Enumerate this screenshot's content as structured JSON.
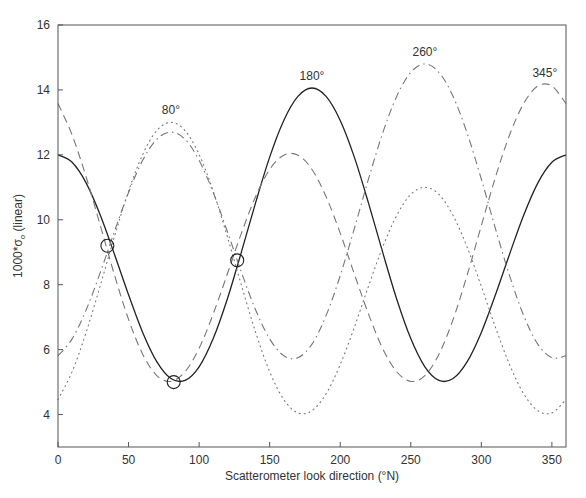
{
  "chart_data": {
    "type": "line",
    "title": "",
    "xlabel": "Scatterometer look direction (°N)",
    "ylabel_main": "1000*σ",
    "ylabel_sub": "o",
    "ylabel_tail": " (linear)",
    "xlim": [
      0,
      360
    ],
    "ylim": [
      3,
      16
    ],
    "xticks": [
      0,
      50,
      100,
      150,
      200,
      250,
      300,
      350
    ],
    "yticks": [
      4,
      6,
      8,
      10,
      12,
      14,
      16
    ],
    "grid": false,
    "x": [
      0,
      10,
      20,
      30,
      40,
      50,
      60,
      70,
      80,
      90,
      100,
      110,
      120,
      130,
      140,
      150,
      160,
      170,
      180,
      190,
      200,
      210,
      220,
      230,
      240,
      250,
      260,
      270,
      280,
      290,
      300,
      310,
      320,
      330,
      340,
      350,
      360
    ],
    "series": [
      {
        "name": "wind direction 180°",
        "style": "solid",
        "color": "#222222",
        "peak_label": "180°",
        "peak_at": [
          180,
          14.06
        ],
        "values": [
          12.0,
          11.77,
          11.13,
          10.14,
          8.94,
          7.69,
          6.53,
          5.63,
          5.11,
          5.05,
          5.47,
          6.34,
          7.56,
          9.01,
          10.52,
          11.93,
          13.06,
          13.8,
          14.06,
          13.8,
          13.06,
          11.93,
          10.52,
          9.01,
          7.56,
          6.34,
          5.47,
          5.05,
          5.11,
          5.63,
          6.53,
          7.69,
          8.94,
          10.14,
          11.13,
          11.77,
          12.0
        ]
      },
      {
        "name": "wind direction 80°",
        "style": "dotted",
        "color": "#777777",
        "peak_label": "80°",
        "peak_at": [
          80,
          13.0
        ],
        "values": [
          4.46,
          5.32,
          6.54,
          7.98,
          9.48,
          10.88,
          12.01,
          12.75,
          13.0,
          12.75,
          12.01,
          10.88,
          9.48,
          7.98,
          6.54,
          5.32,
          4.46,
          4.05,
          4.12,
          4.64,
          5.54,
          6.69,
          7.95,
          9.15,
          10.13,
          10.78,
          11.0,
          10.78,
          10.13,
          9.15,
          7.95,
          6.69,
          5.54,
          4.64,
          4.12,
          4.05,
          4.46
        ]
      },
      {
        "name": "wind direction 260°",
        "style": "dashdot",
        "color": "#777777",
        "peak_label": "260°",
        "peak_at": [
          260,
          14.8
        ],
        "values": [
          5.81,
          6.33,
          7.23,
          8.38,
          9.64,
          10.84,
          11.83,
          12.48,
          12.7,
          12.48,
          11.83,
          10.84,
          9.64,
          8.38,
          7.23,
          6.33,
          5.81,
          5.75,
          6.17,
          7.05,
          8.28,
          9.73,
          11.25,
          12.66,
          13.8,
          14.54,
          14.8,
          14.54,
          13.8,
          12.66,
          11.25,
          9.73,
          8.28,
          7.05,
          6.17,
          5.75,
          5.81
        ]
      },
      {
        "name": "wind direction 345°",
        "style": "dashed",
        "color": "#777777",
        "peak_label": "345°",
        "peak_at": [
          345,
          14.15
        ],
        "values": [
          13.58,
          12.61,
          11.31,
          9.82,
          8.3,
          6.93,
          5.86,
          5.2,
          5.02,
          5.32,
          6.04,
          7.1,
          8.33,
          9.59,
          10.71,
          11.55,
          11.99,
          11.99,
          11.55,
          10.71,
          9.59,
          8.33,
          7.1,
          6.04,
          5.32,
          5.02,
          5.2,
          5.86,
          6.93,
          8.3,
          9.82,
          11.31,
          12.61,
          13.58,
          14.12,
          14.12,
          13.58
        ]
      }
    ],
    "markers": [
      {
        "x": 35,
        "y": 9.2,
        "shape": "open-circle"
      },
      {
        "x": 82,
        "y": 5.0,
        "shape": "open-circle"
      },
      {
        "x": 127,
        "y": 8.75,
        "shape": "open-circle"
      }
    ]
  }
}
